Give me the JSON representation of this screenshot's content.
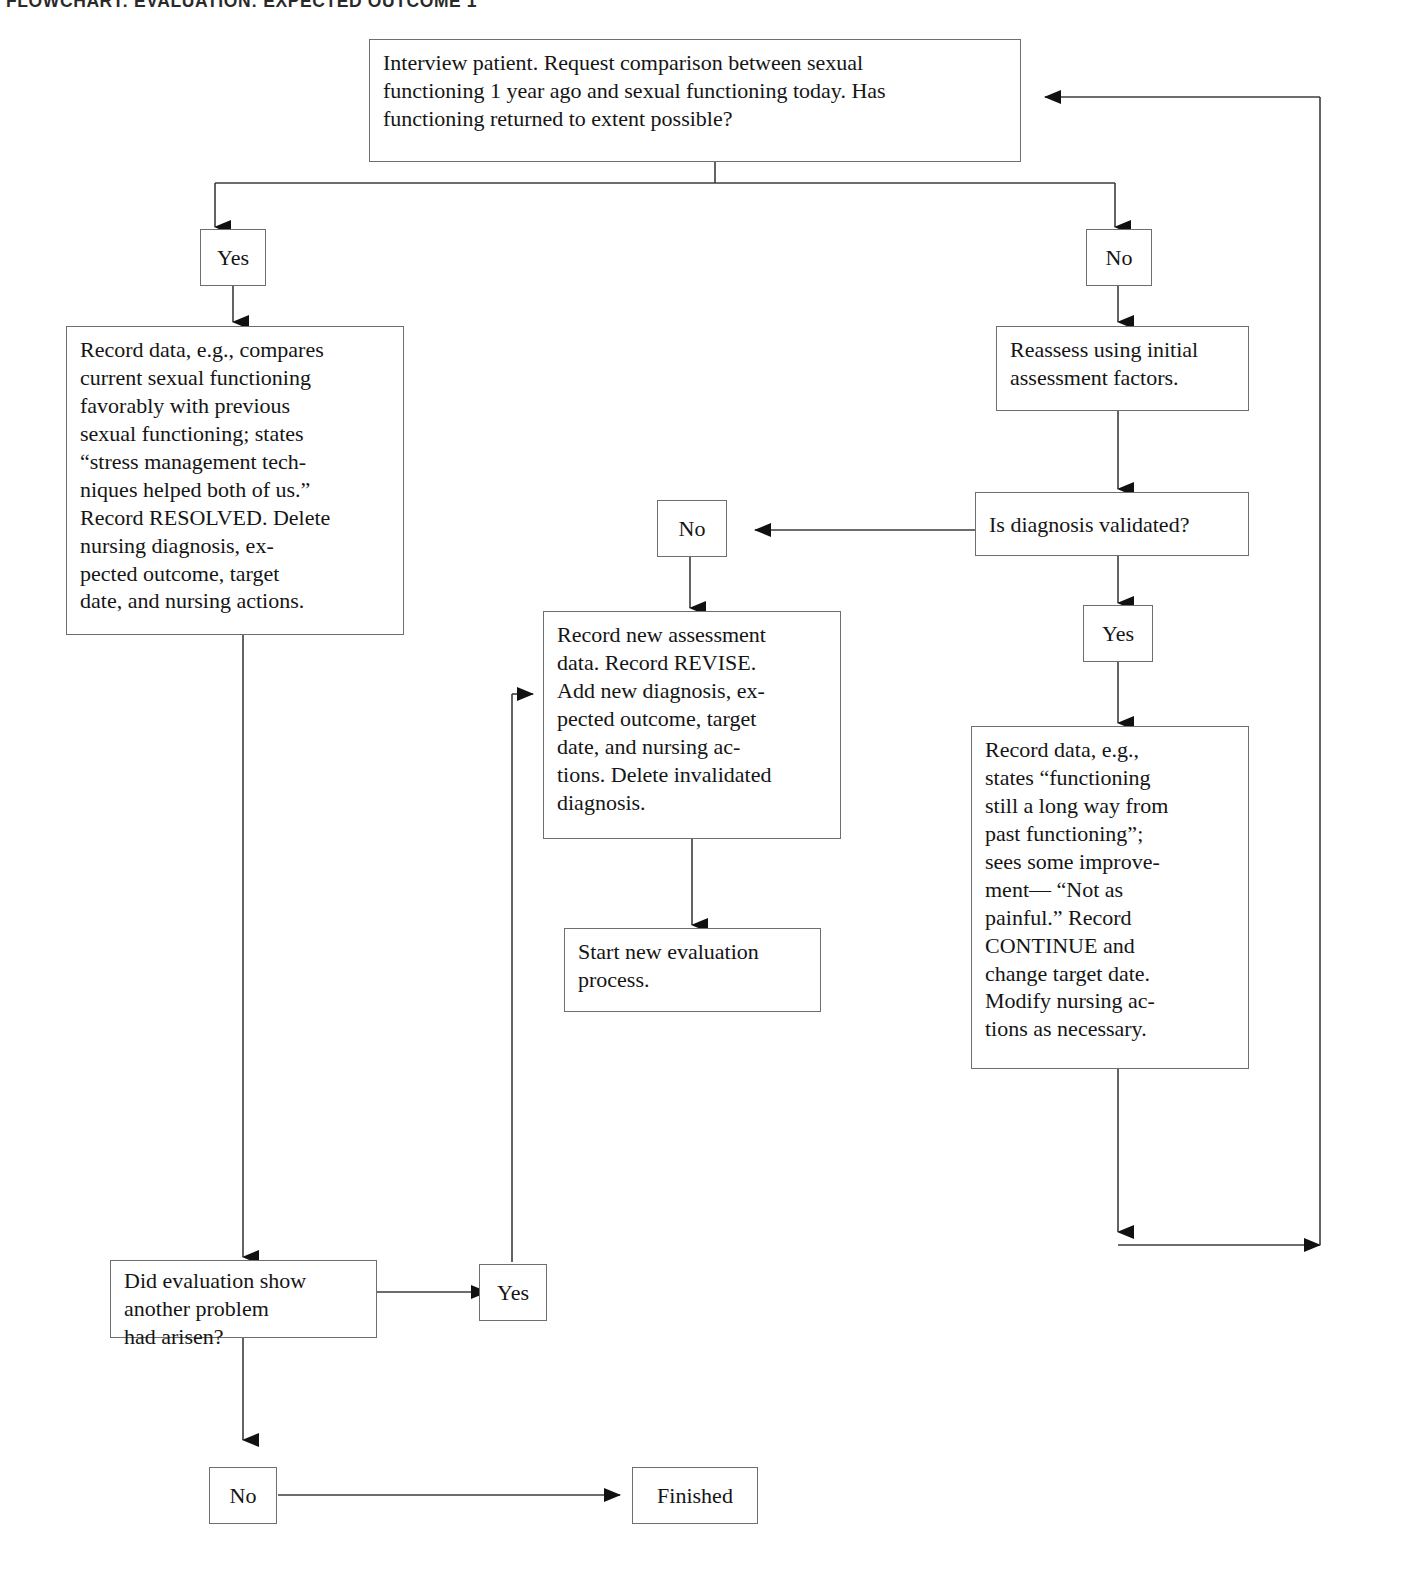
{
  "title": "FLOWCHART: EVALUATION: EXPECTED OUTCOME 1",
  "colors": {
    "background": "#ffffff",
    "box_border": "#6e6e6e",
    "text": "#151515",
    "edge": "#3c3c3c"
  },
  "nodes": {
    "interview": {
      "id": "interview",
      "kind": "process",
      "text": "Interview patient. Request comparison between sexual\nfunctioning 1 year ago and sexual functioning today. Has\nfunctioning returned to extent possible?"
    },
    "yes_top": {
      "id": "yes_top",
      "kind": "label",
      "text": "Yes"
    },
    "no_top": {
      "id": "no_top",
      "kind": "label",
      "text": "No"
    },
    "record_resolved": {
      "id": "record_resolved",
      "kind": "process",
      "text": "Record data, e.g., compares\ncurrent sexual functioning\nfavorably with previous\nsexual functioning; states\n“stress management tech-\nniques helped both of us.”\nRecord RESOLVED. Delete\nnursing diagnosis, ex-\npected outcome, target\ndate, and nursing actions."
    },
    "reassess": {
      "id": "reassess",
      "kind": "process",
      "text": "Reassess using initial\nassessment factors."
    },
    "is_validated": {
      "id": "is_validated",
      "kind": "decision",
      "text": "Is diagnosis validated?"
    },
    "no_mid": {
      "id": "no_mid",
      "kind": "label",
      "text": "No"
    },
    "yes_mid": {
      "id": "yes_mid",
      "kind": "label",
      "text": "Yes"
    },
    "record_revise": {
      "id": "record_revise",
      "kind": "process",
      "text": "Record new assessment\ndata. Record REVISE.\nAdd new diagnosis, ex-\npected outcome, target\ndate, and nursing ac-\ntions. Delete invalidated\ndiagnosis."
    },
    "start_new": {
      "id": "start_new",
      "kind": "process",
      "text": "Start new evaluation\nprocess."
    },
    "record_continue": {
      "id": "record_continue",
      "kind": "process",
      "text": "Record data, e.g.,\nstates “functioning\nstill a long way from\npast functioning”;\nsees some improve-\nment— “Not as\npainful.” Record\nCONTINUE and\nchange target date.\nModify nursing ac-\ntions as necessary."
    },
    "another_problem": {
      "id": "another_problem",
      "kind": "decision",
      "text": "Did evaluation show\nanother problem\nhad arisen?"
    },
    "yes_bottom": {
      "id": "yes_bottom",
      "kind": "label",
      "text": "Yes"
    },
    "no_bottom": {
      "id": "no_bottom",
      "kind": "label",
      "text": "No"
    },
    "finished": {
      "id": "finished",
      "kind": "terminal",
      "text": "Finished"
    }
  }
}
